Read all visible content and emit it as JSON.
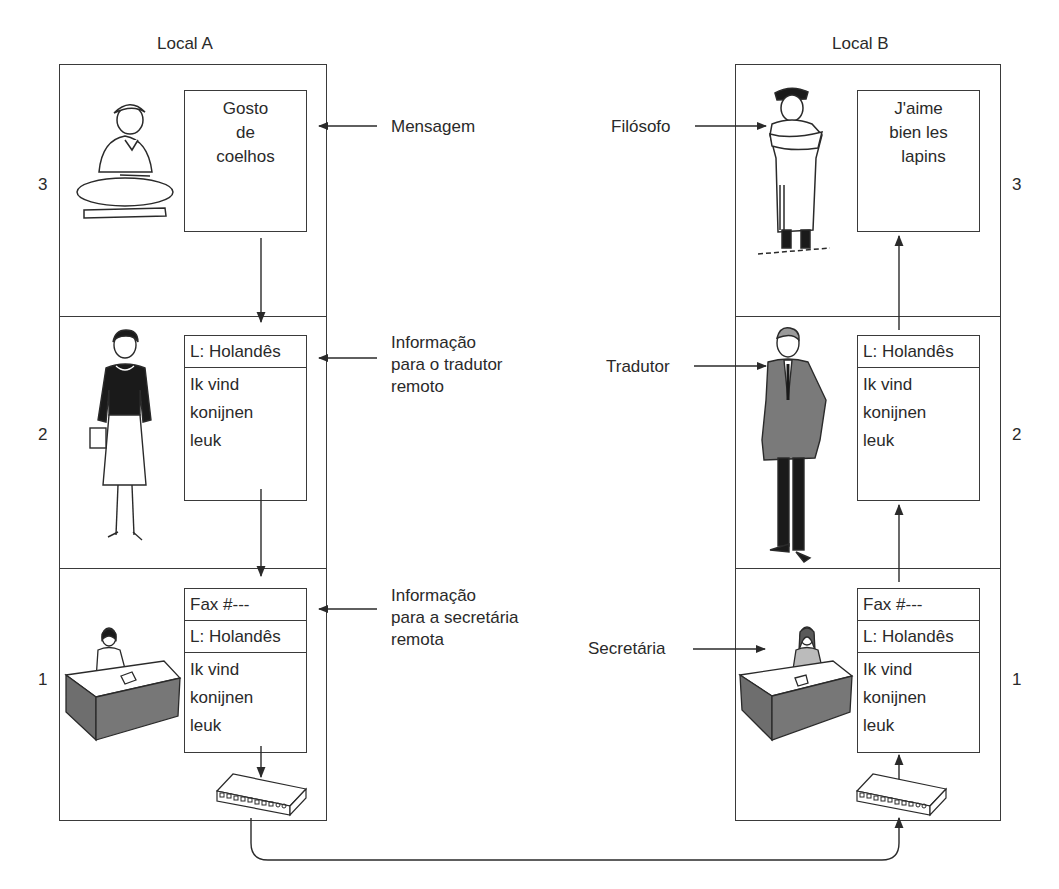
{
  "sites": {
    "a": {
      "title": "Local A",
      "layers": {
        "3": {
          "number": "3",
          "person": "philosopher-a",
          "message_lines": [
            "Gosto",
            "de",
            "coelhos"
          ]
        },
        "2": {
          "number": "2",
          "person": "translator-a",
          "header": "L: Holandês",
          "body_lines": [
            "Ik vind",
            "konijnen",
            "leuk"
          ]
        },
        "1": {
          "number": "1",
          "person": "secretary-a",
          "headers": [
            "Fax #---",
            "L: Holandês"
          ],
          "body_lines": [
            "Ik vind",
            "konijnen",
            "leuk"
          ],
          "device": "fax-machine"
        }
      }
    },
    "b": {
      "title": "Local B",
      "layers": {
        "3": {
          "number": "3",
          "person": "philosopher-b",
          "message_lines": [
            "J'aime",
            "bien les",
            "lapins"
          ]
        },
        "2": {
          "number": "2",
          "person": "translator-b",
          "header": "L: Holandês",
          "body_lines": [
            "Ik vind",
            "konijnen",
            "leuk"
          ]
        },
        "1": {
          "number": "1",
          "person": "secretary-b",
          "headers": [
            "Fax #---",
            "L: Holandês"
          ],
          "body_lines": [
            "Ik vind",
            "konijnen",
            "leuk"
          ],
          "device": "fax-machine"
        }
      }
    }
  },
  "labels": {
    "mensagem": "Mensagem",
    "info_tradutor": [
      "Informação",
      "para o tradutor",
      "remoto"
    ],
    "info_secretaria": [
      "Informação",
      "para a secretária",
      "remota"
    ],
    "filosofo": "Filósofo",
    "tradutor": "Tradutor",
    "secretaria": "Secretária"
  },
  "colors": {
    "line": "#3a3a3a",
    "text": "#2a2a2a",
    "suit_gray": "#7a7a7a",
    "desk_gray": "#6e6e6e"
  }
}
